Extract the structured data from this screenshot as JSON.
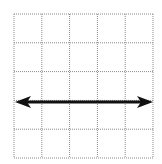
{
  "diagram": {
    "type": "grid-with-arrow",
    "grid": {
      "rows": 5,
      "cols": 5,
      "x0": 14,
      "y0": 14,
      "x1": 153,
      "y1": 158,
      "line_style": "dotted",
      "line_color": "#8a8a8a"
    },
    "arrow": {
      "kind": "double-headed",
      "orientation": "horizontal",
      "y": 102,
      "x_start": 15,
      "x_end": 153,
      "color": "#111111"
    }
  }
}
